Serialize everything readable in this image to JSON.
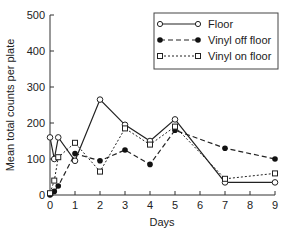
{
  "chart_data": {
    "type": "line",
    "title": "",
    "xlabel": "Days",
    "ylabel": "Mean total counts per plate",
    "xlim": [
      0,
      9
    ],
    "ylim": [
      0,
      500
    ],
    "xticks": [
      0,
      1,
      2,
      3,
      4,
      5,
      6,
      7,
      8,
      9
    ],
    "yticks": [
      0,
      100,
      200,
      300,
      400,
      500
    ],
    "grid": false,
    "legend_position": "upper right",
    "series": [
      {
        "name": "Floor",
        "marker": "open-circle",
        "line": "solid",
        "x": [
          0,
          0.17,
          0.33,
          1,
          2,
          3,
          4,
          5,
          7,
          9
        ],
        "values": [
          160,
          100,
          160,
          95,
          265,
          195,
          150,
          210,
          35,
          35
        ]
      },
      {
        "name": "Vinyl off floor",
        "marker": "filled-circle",
        "line": "dashed",
        "x": [
          0,
          0.17,
          0.33,
          1,
          2,
          3,
          4,
          5,
          7,
          9
        ],
        "values": [
          0,
          10,
          25,
          115,
          95,
          125,
          85,
          180,
          130,
          100
        ]
      },
      {
        "name": "Vinyl on floor",
        "marker": "open-square",
        "line": "dotted",
        "x": [
          0,
          0.17,
          0.33,
          1,
          2,
          3,
          4,
          5,
          7,
          9
        ],
        "values": [
          5,
          40,
          105,
          145,
          65,
          185,
          140,
          190,
          45,
          60
        ]
      }
    ]
  },
  "legend": {
    "items": [
      {
        "label": "Floor"
      },
      {
        "label": "Vinyl off floor"
      },
      {
        "label": "Vinyl on floor"
      }
    ]
  },
  "axes": {
    "xlabel": "Days",
    "ylabel": "Mean total counts per plate"
  }
}
